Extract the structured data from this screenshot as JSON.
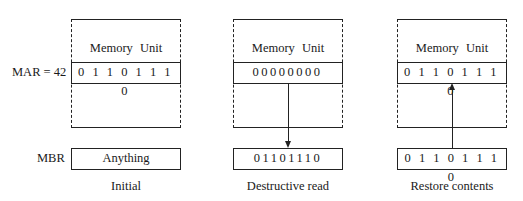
{
  "labels": {
    "mar": "MAR = 42",
    "mbr": "MBR"
  },
  "panels": [
    {
      "memory_title": "Memory Unit",
      "memory_word": "0 1 1 0  1 1 1 0",
      "mbr_value": "Anything",
      "caption": "Initial",
      "arrow": "none"
    },
    {
      "memory_title": "Memory Unit",
      "memory_word": "00000000",
      "mbr_value": "01101110",
      "caption": "Destructive read",
      "arrow": "down"
    },
    {
      "memory_title": "Memory Unit",
      "memory_word": "0 1 1 0 1 1 1 0",
      "mbr_value": "0 1 1 0 1 1 1 0",
      "caption": "Restore contents",
      "arrow": "up"
    }
  ]
}
